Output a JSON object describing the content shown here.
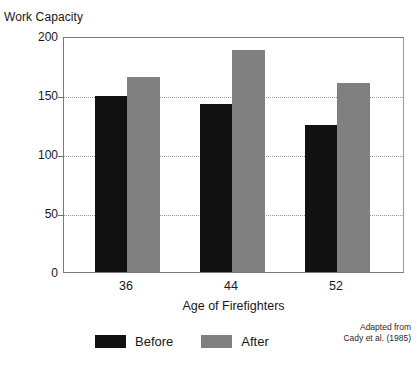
{
  "chart_data": {
    "type": "bar",
    "title": "",
    "categories": [
      "36",
      "44",
      "52"
    ],
    "series": [
      {
        "name": "Before",
        "values": [
          149,
          142,
          125
        ],
        "color": "#111111"
      },
      {
        "name": "After",
        "values": [
          165,
          188,
          160
        ],
        "color": "#808080"
      }
    ],
    "xlabel": "Age of Firefighters",
    "ylabel": "Work Capacity",
    "ylim": [
      0,
      200
    ],
    "yticks": [
      0,
      50,
      100,
      150,
      200
    ],
    "ytick_labels": [
      "0",
      "50",
      "100",
      "150",
      "200"
    ],
    "grid": "horizontal-dotted",
    "legend_position": "bottom-center",
    "annotations": {
      "source_line1": "Adapted from",
      "source_line2": "Cady et al. (1985)"
    }
  }
}
